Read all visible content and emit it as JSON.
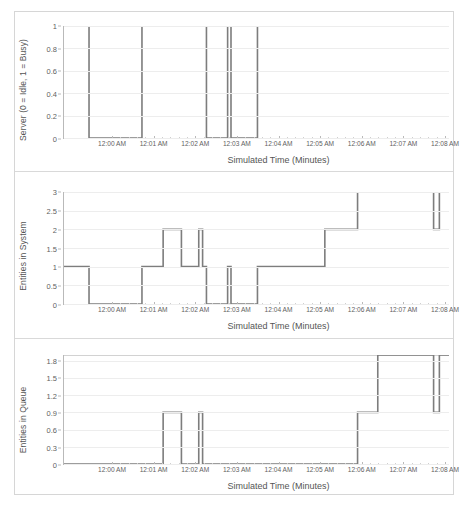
{
  "figure": {
    "background": "#ffffff",
    "frame_color": "#d6d6d6",
    "line_color": "#7d7d7d",
    "grid_color": "#ededed",
    "axis_color": "#b9b9b9",
    "text_color": "#5f5f5f"
  },
  "shared": {
    "xlabel": "Simulated Time (Minutes)",
    "xticklabels": [
      "12:00 AM",
      "12:01 AM",
      "12:02 AM",
      "12:03 AM",
      "12:04 AM",
      "12:05 AM",
      "12:06 AM",
      "12:07 AM",
      "12:08 AM"
    ]
  },
  "chart_data": [
    {
      "type": "line",
      "id": "server-utilization",
      "title": "",
      "xlabel": "Simulated Time (Minutes)",
      "ylabel": "Server (0 = Idle, 1 = Busy)",
      "xlim": [
        0,
        8
      ],
      "ylim": [
        0,
        1
      ],
      "grid": true,
      "legend": "none",
      "drawstyle": "steps-post",
      "xticklabels": [
        "12:00 AM",
        "12:01 AM",
        "12:02 AM",
        "12:03 AM",
        "12:04 AM",
        "12:05 AM",
        "12:06 AM",
        "12:07 AM",
        "12:08 AM"
      ],
      "xticks": [
        0,
        1,
        2,
        3,
        4,
        5,
        6,
        7,
        8
      ],
      "yticks": [
        0,
        0.2,
        0.4,
        0.6,
        0.8,
        1
      ],
      "yticklabels": [
        "0",
        "0.2",
        "0.4",
        "0.6",
        "0.8",
        "1"
      ],
      "series": [
        {
          "name": "Server state",
          "x": [
            0.0,
            0.52,
            1.62,
            2.96,
            3.4,
            3.47,
            4.02,
            8.0
          ],
          "values": [
            1,
            0,
            1,
            0,
            1,
            0,
            1,
            1
          ]
        }
      ]
    },
    {
      "type": "line",
      "id": "entities-in-system",
      "title": "",
      "xlabel": "Simulated Time (Minutes)",
      "ylabel": "Entities in System",
      "xlim": [
        0,
        8
      ],
      "ylim": [
        0,
        3
      ],
      "grid": true,
      "legend": "none",
      "drawstyle": "steps-post",
      "xticklabels": [
        "12:00 AM",
        "12:01 AM",
        "12:02 AM",
        "12:03 AM",
        "12:04 AM",
        "12:05 AM",
        "12:06 AM",
        "12:07 AM",
        "12:08 AM"
      ],
      "xticks": [
        0,
        1,
        2,
        3,
        4,
        5,
        6,
        7,
        8
      ],
      "yticks": [
        0,
        0.5,
        1,
        1.5,
        2,
        2.5,
        3
      ],
      "yticklabels": [
        "0",
        "0.5",
        "1",
        "1.5",
        "2",
        "2.5",
        "3"
      ],
      "series": [
        {
          "name": "Entities in system",
          "x": [
            0.0,
            0.52,
            1.62,
            2.06,
            2.44,
            2.8,
            2.88,
            2.96,
            3.4,
            3.47,
            4.02,
            5.42,
            6.1,
            7.68,
            7.8,
            7.92,
            8.0
          ],
          "values": [
            1,
            0,
            1,
            2,
            1,
            2,
            1,
            0,
            1,
            0,
            1,
            2,
            3,
            2,
            3,
            3,
            3
          ]
        }
      ]
    },
    {
      "type": "line",
      "id": "entities-in-queue",
      "title": "",
      "xlabel": "Simulated Time (Minutes)",
      "ylabel": "Entities in Queue",
      "xlim": [
        0,
        8
      ],
      "ylim": [
        0,
        1.9
      ],
      "grid": true,
      "legend": "none",
      "drawstyle": "steps-post",
      "xticklabels": [
        "12:00 AM",
        "12:01 AM",
        "12:02 AM",
        "12:03 AM",
        "12:04 AM",
        "12:05 AM",
        "12:06 AM",
        "12:07 AM",
        "12:08 AM"
      ],
      "xticks": [
        0,
        1,
        2,
        3,
        4,
        5,
        6,
        7,
        8
      ],
      "yticks": [
        0,
        0.3,
        0.6,
        0.9,
        1.2,
        1.5,
        1.8
      ],
      "yticklabels": [
        "0",
        "0.3",
        "0.6",
        "0.9",
        "1.2",
        "1.5",
        "1.8"
      ],
      "series": [
        {
          "name": "Entities in queue",
          "x": [
            0.0,
            2.06,
            2.44,
            2.8,
            2.88,
            6.1,
            6.52,
            7.68,
            7.8,
            7.92,
            8.0
          ],
          "values": [
            0,
            0.9,
            0,
            0.9,
            0,
            0.9,
            1.9,
            0.9,
            1.9,
            1.9,
            1.9
          ]
        }
      ]
    }
  ]
}
